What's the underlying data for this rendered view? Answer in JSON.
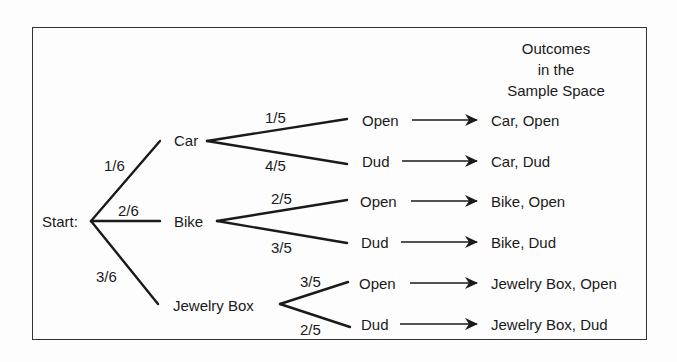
{
  "header": {
    "line1": "Outcomes",
    "line2": "in the",
    "line3": "Sample Space"
  },
  "start": {
    "label": "Start:"
  },
  "first_level": [
    {
      "label": "Car",
      "prob": "1/6"
    },
    {
      "label": "Bike",
      "prob": "2/6"
    },
    {
      "label": "Jewelry Box",
      "prob": "3/6"
    }
  ],
  "second_level": {
    "car": [
      {
        "label": "Open",
        "prob": "1/5",
        "outcome": "Car, Open"
      },
      {
        "label": "Dud",
        "prob": "4/5",
        "outcome": "Car, Dud"
      }
    ],
    "bike": [
      {
        "label": "Open",
        "prob": "2/5",
        "outcome": "Bike, Open"
      },
      {
        "label": "Dud",
        "prob": "3/5",
        "outcome": "Bike, Dud"
      }
    ],
    "jewelry": [
      {
        "label": "Open",
        "prob": "3/5",
        "outcome": "Jewelry Box, Open"
      },
      {
        "label": "Dud",
        "prob": "2/5",
        "outcome": "Jewelry Box, Dud"
      }
    ]
  },
  "colors": {
    "line": "#1a1a1a",
    "frame": "#333333"
  }
}
